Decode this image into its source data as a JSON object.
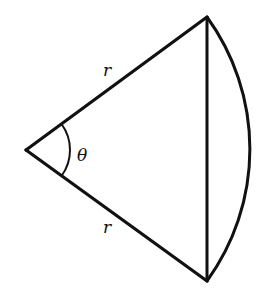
{
  "diagram": {
    "type": "circular-sector-with-chord",
    "vertex": {
      "x": 26,
      "y": 150
    },
    "top_point": {
      "x": 207,
      "y": 17
    },
    "bottom_point": {
      "x": 207,
      "y": 281
    },
    "radius_px": 224.6,
    "stroke_color": "#111111",
    "labels": {
      "radius_top": "r",
      "radius_bottom": "r",
      "angle": "θ"
    }
  }
}
